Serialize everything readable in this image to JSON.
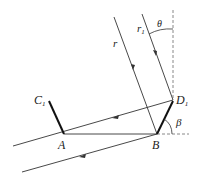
{
  "diagram": {
    "labels": {
      "r": "r",
      "r1": "r",
      "r1_sub": "1",
      "theta": "θ",
      "beta": "β",
      "C1": "C",
      "C1_sub": "1",
      "D1": "D",
      "D1_sub": "1",
      "A": "A",
      "B": "B"
    },
    "points": {
      "A": [
        64,
        134
      ],
      "B": [
        157,
        134
      ],
      "C1": [
        49,
        100
      ],
      "D1": [
        173,
        100
      ]
    },
    "colors": {
      "line": "#333333",
      "dashed": "#888888",
      "background": "#ffffff"
    }
  }
}
